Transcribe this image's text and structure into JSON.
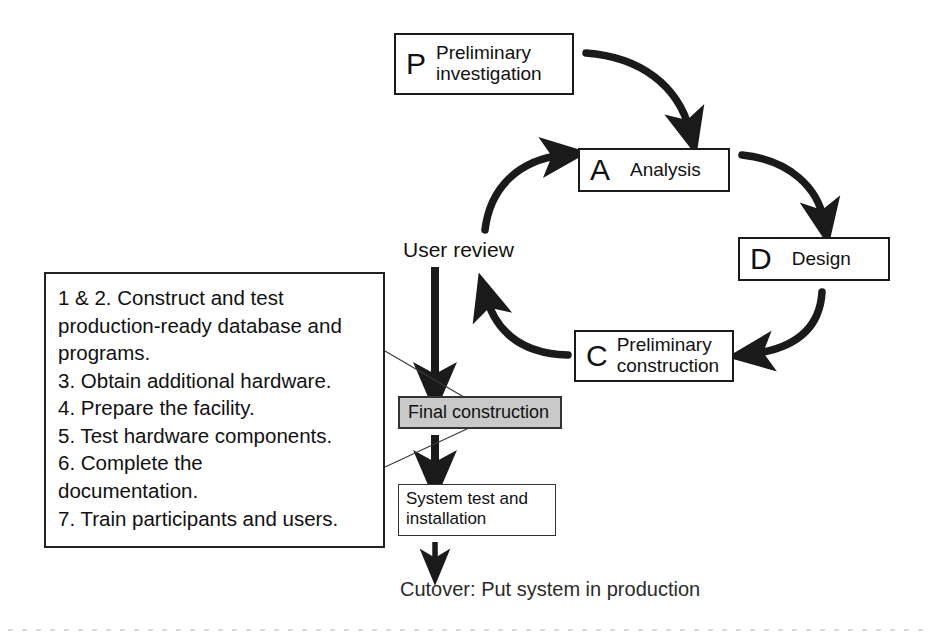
{
  "diagram": {
    "accent_shaded_fill": "#c9c9c9",
    "line_color": "#1a1a1a",
    "background": "#ffffff"
  },
  "phases": [
    {
      "key": "P",
      "letter": "P",
      "label": "Preliminary\ninvestigation"
    },
    {
      "key": "A",
      "letter": "A",
      "label": "Analysis"
    },
    {
      "key": "D",
      "letter": "D",
      "label": "Design"
    },
    {
      "key": "C",
      "letter": "C",
      "label": "Preliminary\nconstruction"
    }
  ],
  "nodes": {
    "preliminary_investigation": {
      "letter": "P",
      "line1": "Preliminary",
      "line2": "investigation"
    },
    "analysis": {
      "letter": "A",
      "label": "Analysis"
    },
    "design": {
      "letter": "D",
      "label": "Design"
    },
    "preliminary_construction": {
      "letter": "C",
      "line1": "Preliminary",
      "line2": "construction"
    },
    "final_construction": {
      "label": "Final construction"
    },
    "system_test": {
      "line1": "System test and",
      "line2": "installation"
    }
  },
  "labels": {
    "user_review": "User review",
    "cutover": "Cutover: Put system in production"
  },
  "tasklist": {
    "lines": [
      "1 & 2. Construct and test",
      "production-ready database and",
      "programs.",
      "3. Obtain additional hardware.",
      "4. Prepare the facility.",
      "5. Test hardware components.",
      "6. Complete the",
      "documentation.",
      "7. Train participants and users."
    ]
  },
  "flows": [
    {
      "name": "p-to-a",
      "from": "Preliminary investigation",
      "to": "Analysis",
      "style": "curved-arrow"
    },
    {
      "name": "a-to-d",
      "from": "Analysis",
      "to": "Design",
      "style": "curved-arrow"
    },
    {
      "name": "d-to-c",
      "from": "Design",
      "to": "Preliminary construction",
      "style": "curved-arrow"
    },
    {
      "name": "c-to-user-review",
      "from": "Preliminary construction",
      "to": "User review",
      "style": "curved-arrow"
    },
    {
      "name": "user-review-to-a",
      "from": "User review",
      "to": "Analysis",
      "style": "curved-arrow"
    },
    {
      "name": "user-review-to-final-construction",
      "from": "User review",
      "to": "Final construction",
      "style": "straight-arrow"
    },
    {
      "name": "final-construction-to-system-test",
      "from": "Final construction",
      "to": "System test and installation",
      "style": "straight-arrow"
    },
    {
      "name": "system-test-to-cutover",
      "from": "System test and installation",
      "to": "Cutover: Put system in production",
      "style": "straight-arrow"
    },
    {
      "name": "tasklist-callout",
      "from": "Task list",
      "to": "Final construction",
      "style": "leader-line"
    }
  ]
}
